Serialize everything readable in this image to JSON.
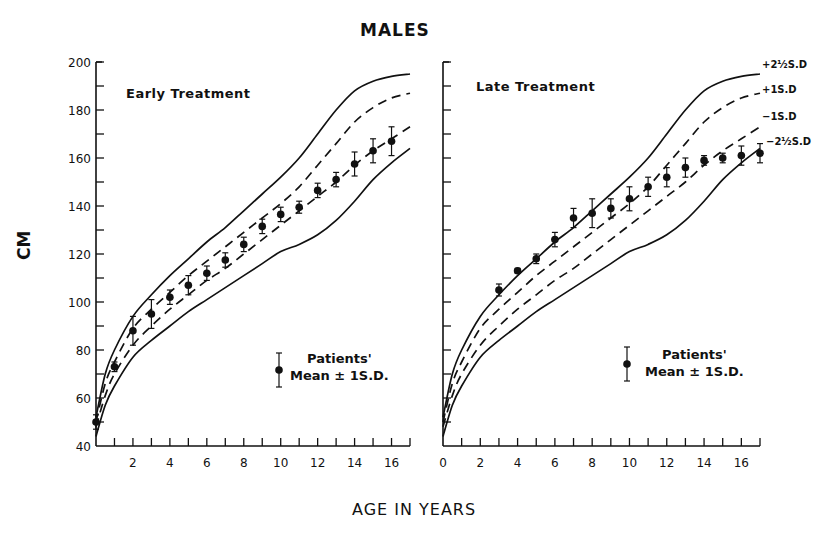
{
  "title": "MALES",
  "ylabel": "CM",
  "xlabel": "AGE IN YEARS",
  "legend": {
    "line1": "Patients'",
    "line2": "Mean ± 1S.D."
  },
  "sd_labels": [
    "+2½S.D",
    "+1S.D",
    "−1S.D",
    "−2½S.D"
  ],
  "chart_data": [
    {
      "type": "line",
      "title": "Early Treatment",
      "xlabel": "AGE IN YEARS",
      "ylabel": "CM",
      "xlim": [
        0,
        17
      ],
      "ylim": [
        40,
        200
      ],
      "x_ticks": [
        2,
        4,
        6,
        8,
        10,
        12,
        14,
        16
      ],
      "y_ticks": [
        40,
        60,
        80,
        100,
        120,
        140,
        160,
        180,
        200
      ],
      "grid": false,
      "reference_curves": [
        {
          "name": "+2½S.D",
          "style": "solid",
          "x": [
            0,
            0.5,
            1,
            2,
            3,
            4,
            5,
            6,
            7,
            8,
            9,
            10,
            11,
            12,
            13,
            14,
            15,
            16,
            17
          ],
          "y": [
            52,
            70,
            80,
            94,
            103,
            111,
            118,
            125,
            131,
            138,
            145,
            152,
            160,
            170,
            180,
            188,
            192,
            194,
            195
          ]
        },
        {
          "name": "+1S.D",
          "style": "dashed",
          "x": [
            0,
            0.5,
            1,
            2,
            3,
            4,
            5,
            6,
            7,
            8,
            9,
            10,
            11,
            12,
            13,
            14,
            15,
            16,
            17
          ],
          "y": [
            50,
            66,
            75,
            89,
            97,
            104,
            111,
            117,
            123,
            129,
            135,
            141,
            148,
            157,
            166,
            175,
            181,
            185,
            187
          ]
        },
        {
          "name": "−1S.D",
          "style": "dashed",
          "x": [
            0,
            0.5,
            1,
            2,
            3,
            4,
            5,
            6,
            7,
            8,
            9,
            10,
            11,
            12,
            13,
            14,
            15,
            16,
            17
          ],
          "y": [
            48,
            61,
            70,
            82,
            90,
            97,
            103,
            109,
            114,
            120,
            126,
            132,
            138,
            144,
            150,
            157,
            163,
            168,
            173
          ]
        },
        {
          "name": "−2½S.D",
          "style": "solid",
          "x": [
            0,
            0.5,
            1,
            2,
            3,
            4,
            5,
            6,
            7,
            8,
            9,
            10,
            11,
            12,
            13,
            14,
            15,
            16,
            17
          ],
          "y": [
            44,
            57,
            65,
            77,
            84,
            90,
            96,
            101,
            106,
            111,
            116,
            121,
            124,
            128,
            134,
            142,
            151,
            158,
            164
          ]
        }
      ],
      "series": [
        {
          "name": "Patients' Mean ± 1S.D.",
          "x": [
            0,
            1,
            2,
            3,
            4,
            5,
            6,
            7,
            8,
            9,
            10,
            11,
            12,
            13,
            14,
            15,
            16
          ],
          "y": [
            50,
            73,
            88,
            95,
            102,
            107,
            112,
            117.5,
            124,
            131.5,
            136.5,
            139.5,
            146.5,
            151,
            157.5,
            163,
            167
          ],
          "sd": [
            3,
            2,
            6,
            6,
            3,
            4,
            3,
            3,
            3,
            3,
            3,
            2.5,
            3,
            3,
            5,
            5,
            6
          ]
        }
      ]
    },
    {
      "type": "line",
      "title": "Late Treatment",
      "xlabel": "AGE IN YEARS",
      "ylabel": "CM",
      "xlim": [
        0,
        17
      ],
      "ylim": [
        40,
        200
      ],
      "x_ticks": [
        0,
        2,
        4,
        6,
        8,
        10,
        12,
        14,
        16
      ],
      "y_ticks": [
        40,
        60,
        80,
        100,
        120,
        140,
        160,
        180,
        200
      ],
      "grid": false,
      "reference_curves": [
        {
          "name": "+2½S.D",
          "style": "solid",
          "x": [
            0,
            0.5,
            1,
            2,
            3,
            4,
            5,
            6,
            7,
            8,
            9,
            10,
            11,
            12,
            13,
            14,
            15,
            16,
            17
          ],
          "y": [
            52,
            70,
            80,
            94,
            103,
            111,
            118,
            125,
            131,
            138,
            145,
            152,
            160,
            170,
            180,
            188,
            192,
            194,
            195
          ]
        },
        {
          "name": "+1S.D",
          "style": "dashed",
          "x": [
            0,
            0.5,
            1,
            2,
            3,
            4,
            5,
            6,
            7,
            8,
            9,
            10,
            11,
            12,
            13,
            14,
            15,
            16,
            17
          ],
          "y": [
            50,
            66,
            75,
            89,
            97,
            104,
            111,
            117,
            123,
            129,
            135,
            141,
            148,
            157,
            166,
            175,
            181,
            185,
            187
          ]
        },
        {
          "name": "−1S.D",
          "style": "dashed",
          "x": [
            0,
            0.5,
            1,
            2,
            3,
            4,
            5,
            6,
            7,
            8,
            9,
            10,
            11,
            12,
            13,
            14,
            15,
            16,
            17
          ],
          "y": [
            48,
            61,
            70,
            82,
            90,
            97,
            103,
            109,
            114,
            120,
            126,
            132,
            138,
            144,
            150,
            157,
            163,
            168,
            173
          ]
        },
        {
          "name": "−2½S.D",
          "style": "solid",
          "x": [
            0,
            0.5,
            1,
            2,
            3,
            4,
            5,
            6,
            7,
            8,
            9,
            10,
            11,
            12,
            13,
            14,
            15,
            16,
            17
          ],
          "y": [
            44,
            57,
            65,
            77,
            84,
            90,
            96,
            101,
            106,
            111,
            116,
            121,
            124,
            128,
            134,
            142,
            151,
            158,
            164
          ]
        }
      ],
      "series": [
        {
          "name": "Patients' Mean ± 1S.D.",
          "x": [
            3,
            4,
            5,
            6,
            7,
            8,
            9,
            10,
            11,
            12,
            13,
            14,
            15,
            16,
            17
          ],
          "y": [
            105,
            113,
            118,
            126,
            135,
            137,
            139,
            143,
            148,
            152,
            156,
            159,
            160,
            161,
            162
          ],
          "sd": [
            2.5,
            1,
            2,
            3,
            4,
            6,
            4,
            5,
            4,
            4,
            4,
            2,
            2,
            4,
            4
          ]
        }
      ]
    }
  ]
}
